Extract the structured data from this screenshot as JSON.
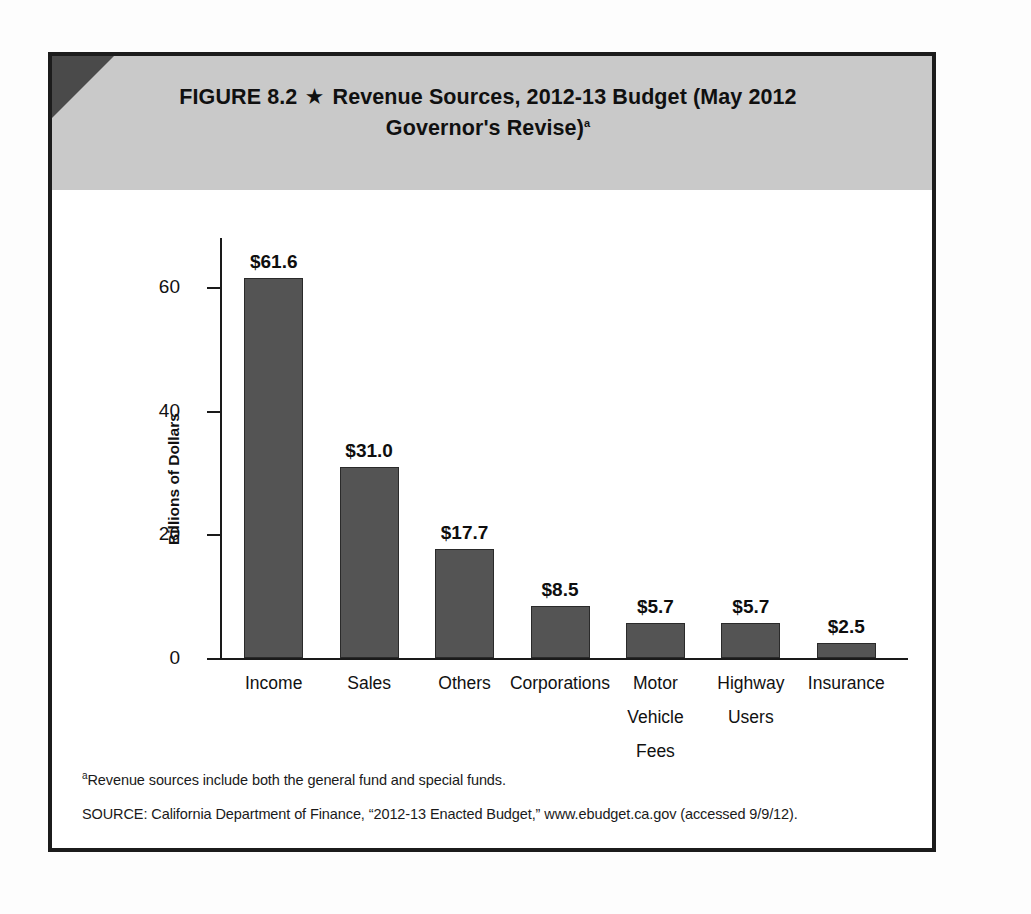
{
  "figure": {
    "label": "FIGURE 8.2",
    "star_icon": "★",
    "title_line1": "Revenue Sources, 2012-13 Budget (May 2012",
    "title_line2": "Governor's Revise)",
    "title_footnote_marker": "a",
    "header_bg_color": "#c9c9c9",
    "corner_color": "#4a4a4a",
    "border_color": "#1c1c1c"
  },
  "notes": {
    "footnote_marker": "a",
    "footnote_text": "Revenue sources include both the general fund and special funds.",
    "source_text": "SOURCE: California Department of Finance, “2012-13 Enacted Budget,” www.ebudget.ca.gov (accessed 9/9/12)."
  },
  "ghost_text": {
    "line1": "What is in the budget?"
  },
  "chart_data": {
    "type": "bar",
    "title": "Revenue Sources, 2012-13 Budget (May 2012 Governor's Revise)",
    "xlabel": "",
    "ylabel": "Billions of Dollars",
    "ylim": [
      0,
      68
    ],
    "yticks": [
      0,
      20,
      40,
      60
    ],
    "ytick_labels": [
      "0",
      "20",
      "40",
      "60"
    ],
    "grid": false,
    "legend": false,
    "bar_color": "#545454",
    "categories": [
      "Income",
      "Sales",
      "Others",
      "Corporations",
      "Motor Vehicle Fees",
      "Highway Users",
      "Insurance"
    ],
    "category_lines": [
      [
        "Income"
      ],
      [
        "Sales"
      ],
      [
        "Others"
      ],
      [
        "Corporations"
      ],
      [
        "Motor",
        "Vehicle",
        "Fees"
      ],
      [
        "Highway",
        "Users"
      ],
      [
        "Insurance"
      ]
    ],
    "values": [
      61.6,
      31.0,
      17.7,
      8.5,
      5.7,
      5.7,
      2.5
    ],
    "value_labels": [
      "$61.6",
      "$31.0",
      "$17.7",
      "$8.5",
      "$5.7",
      "$5.7",
      "$2.5"
    ]
  }
}
